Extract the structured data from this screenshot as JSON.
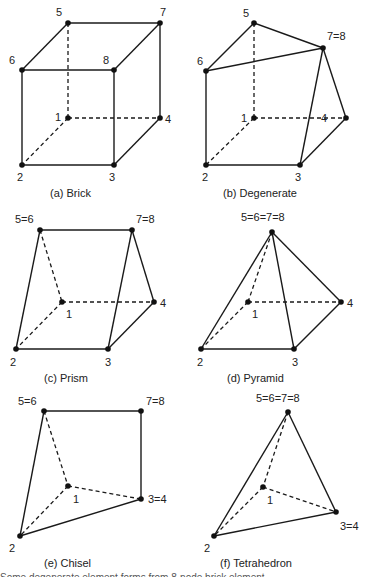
{
  "figure": {
    "panels": [
      {
        "id": "a",
        "caption": "(a) Brick",
        "labels": {
          "n1": "1",
          "n2": "2",
          "n3": "3",
          "n4": "4",
          "n5": "5",
          "n6": "6",
          "n7": "7",
          "n8": "8"
        }
      },
      {
        "id": "b",
        "caption": "(b) Degenerate",
        "labels": {
          "n1": "1",
          "n2": "2",
          "n3": "3",
          "n4": "4",
          "n5": "5",
          "n6": "6",
          "n78": "7=8"
        }
      },
      {
        "id": "c",
        "caption": "(c) Prism",
        "labels": {
          "n1": "1",
          "n2": "2",
          "n3": "3",
          "n4": "4",
          "n56": "5=6",
          "n78": "7=8"
        }
      },
      {
        "id": "d",
        "caption": "(d) Pyramid",
        "labels": {
          "n1": "1",
          "n2": "2",
          "n3": "3",
          "n4": "4",
          "n5678": "5=6=7=8"
        }
      },
      {
        "id": "e",
        "caption": "(e) Chisel",
        "labels": {
          "n1": "1",
          "n2": "2",
          "n34": "3=4",
          "n56": "5=6",
          "n78": "7=8"
        }
      },
      {
        "id": "f",
        "caption": "(f) Tetrahedron",
        "labels": {
          "n1": "1",
          "n2": "2",
          "n34": "3=4",
          "n5678": "5=6=7=8"
        }
      }
    ],
    "footer_partial": "Some degenerate element forms from 8-node brick element"
  }
}
